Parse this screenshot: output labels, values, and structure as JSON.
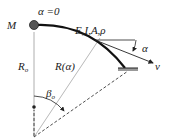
{
  "diagram": {
    "labels": {
      "moment": "M",
      "alpha_zero": "α =0",
      "properties": "E,I,A,ρ",
      "alpha": "α",
      "velocity": "v",
      "radius0": "R",
      "radius0_sub": "o",
      "radius_alpha": "R(α)",
      "beta0": "β",
      "beta0_sub": "o"
    },
    "colors": {
      "line": "#222222",
      "mass": "#555555",
      "support": "#999999"
    }
  }
}
